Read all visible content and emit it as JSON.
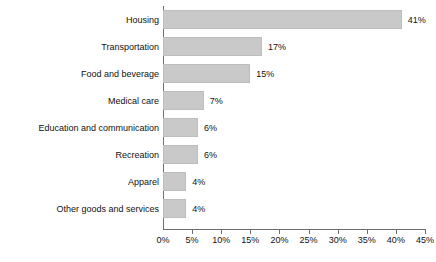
{
  "chart_data": {
    "type": "bar",
    "orientation": "horizontal",
    "title": "",
    "xlabel": "",
    "ylabel": "",
    "xlim": [
      0,
      45
    ],
    "grid": false,
    "legend": null,
    "categories": [
      "Housing",
      "Transportation",
      "Food and beverage",
      "Medical care",
      "Education and communication",
      "Recreation",
      "Apparel",
      "Other goods and services"
    ],
    "values": [
      41,
      17,
      15,
      7,
      6,
      6,
      4,
      4
    ],
    "value_labels": [
      "41%",
      "17%",
      "15%",
      "7%",
      "6%",
      "6%",
      "4%",
      "4%"
    ],
    "xticks": [
      0,
      5,
      10,
      15,
      20,
      25,
      30,
      35,
      40,
      45
    ],
    "xtick_labels": [
      "0%",
      "5%",
      "10%",
      "15%",
      "20%",
      "25%",
      "30%",
      "35%",
      "40%",
      "45%"
    ],
    "bar_color": "#c9c9c9",
    "axis_color": "#6e6e6e",
    "text_color": "#111111"
  }
}
